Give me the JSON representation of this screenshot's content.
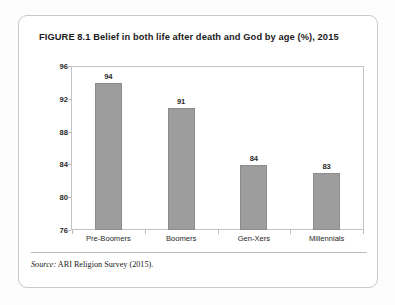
{
  "figure": {
    "title": "FIGURE 8.1  Belief in both life after death and God by age (%), 2015",
    "source_label": "Source:",
    "source_text": " ARI Religion Survey (2015)."
  },
  "chart_data": {
    "type": "bar",
    "title": "Belief in both life after death and God by age (%), 2015",
    "xlabel": "",
    "ylabel": "",
    "categories": [
      "Pre-Boomers",
      "Boomers",
      "Gen-Xers",
      "Millennials"
    ],
    "values": [
      94,
      91,
      84,
      83
    ],
    "value_labels": [
      "94",
      "91",
      "84",
      "83"
    ],
    "ylim": [
      76,
      96
    ],
    "ytick_labels": [
      "96",
      "92",
      "88",
      "84",
      "80",
      "76"
    ],
    "yticks": [
      96,
      92,
      88,
      84,
      80,
      76
    ],
    "grid": false,
    "legend": null,
    "bar_color": "#9d9d9d",
    "bar_border_color": "#8c8c8c",
    "plot_border_color": "#c3c3c3"
  }
}
